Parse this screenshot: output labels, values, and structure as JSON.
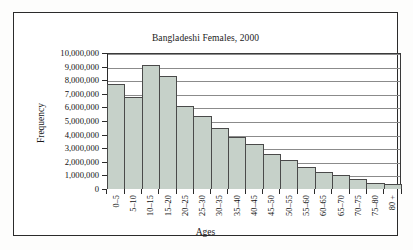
{
  "chart_data": {
    "type": "bar",
    "title": "Bangladeshi Females, 2000",
    "xlabel": "Ages",
    "ylabel": "Frequency",
    "categories": [
      "0–5",
      "5–10",
      "10–15",
      "15–20",
      "20–25",
      "25–30",
      "30–35",
      "35–40",
      "40–45",
      "45–50",
      "50–55",
      "55–60",
      "60–65",
      "65–70",
      "70–75",
      "75–80",
      "80 +"
    ],
    "values": [
      7700000,
      6750000,
      9150000,
      8300000,
      6100000,
      5400000,
      4450000,
      3800000,
      3300000,
      2600000,
      2100000,
      1600000,
      1280000,
      1000000,
      720000,
      450000,
      380000
    ],
    "ylim": [
      0,
      10000000
    ],
    "ytick_values": [
      0,
      1000000,
      2000000,
      3000000,
      4000000,
      5000000,
      6000000,
      7000000,
      8000000,
      9000000,
      10000000
    ],
    "ytick_labels": [
      "0",
      "1,000,000",
      "2,000,000",
      "3,000,000",
      "4,000,000",
      "5,000,000",
      "6,000,000",
      "7,000,000",
      "8,000,000",
      "9,000,000",
      "10,000,000"
    ],
    "grid": true,
    "legend": false,
    "bar_color": "#c6d1c9",
    "bar_edge_color": "#4a4a4a",
    "axis_color": "#2b2b2b",
    "grid_color": "#8b8b8b"
  }
}
